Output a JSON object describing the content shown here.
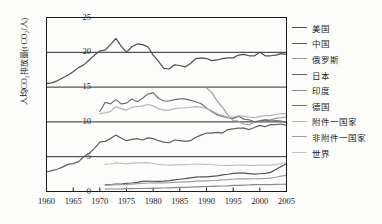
{
  "chart_data": {
    "type": "line",
    "title": "",
    "xlabel": "",
    "ylabel": "人均CO₂排放量(t CO₂/人)",
    "ylabel_main": "人均CO",
    "ylabel_sub": "2",
    "ylabel_tail": "排放量(t CO",
    "ylabel_sub2": "2",
    "ylabel_end": "/人)",
    "xlim": [
      1960,
      2005
    ],
    "ylim": [
      0,
      25
    ],
    "xticks": [
      1960,
      1965,
      1970,
      1975,
      1980,
      1985,
      1990,
      1995,
      2000,
      2005
    ],
    "yticks": [
      0,
      5,
      10,
      15,
      20,
      25
    ],
    "grid": "horizontal",
    "legend_position": "right",
    "series": [
      {
        "name": "美国",
        "color": "#4d4d4d",
        "x": [
          1960,
          1961,
          1962,
          1963,
          1964,
          1965,
          1966,
          1967,
          1968,
          1969,
          1970,
          1971,
          1972,
          1973,
          1974,
          1975,
          1976,
          1977,
          1978,
          1979,
          1980,
          1981,
          1982,
          1983,
          1984,
          1985,
          1986,
          1987,
          1988,
          1989,
          1990,
          1991,
          1992,
          1993,
          1994,
          1995,
          1996,
          1997,
          1998,
          1999,
          2000,
          2001,
          2002,
          2003,
          2004,
          2005
        ],
        "values": [
          15.5,
          15.6,
          15.9,
          16.3,
          16.7,
          17.2,
          17.8,
          18.2,
          18.9,
          19.6,
          20.2,
          20.3,
          21.1,
          22.0,
          20.9,
          20.0,
          20.8,
          21.2,
          21.1,
          20.8,
          19.6,
          18.7,
          17.7,
          17.6,
          18.2,
          18.1,
          17.9,
          18.4,
          19.1,
          19.2,
          19.1,
          18.8,
          18.9,
          19.1,
          19.2,
          19.2,
          19.6,
          19.7,
          19.5,
          19.5,
          20.0,
          19.5,
          19.5,
          19.6,
          19.8,
          19.7
        ]
      },
      {
        "name": "中国",
        "color": "#555555",
        "x": [
          1971,
          1972,
          1973,
          1974,
          1975,
          1976,
          1977,
          1978,
          1979,
          1980,
          1981,
          1982,
          1983,
          1984,
          1985,
          1986,
          1987,
          1988,
          1989,
          1990,
          1991,
          1992,
          1993,
          1994,
          1995,
          1996,
          1997,
          1998,
          1999,
          2000,
          2001,
          2002,
          2003,
          2004,
          2005
        ],
        "values": [
          0.95,
          1.0,
          1.05,
          1.05,
          1.18,
          1.22,
          1.32,
          1.45,
          1.48,
          1.47,
          1.45,
          1.5,
          1.57,
          1.68,
          1.76,
          1.85,
          1.96,
          2.07,
          2.12,
          2.1,
          2.18,
          2.25,
          2.38,
          2.48,
          2.6,
          2.65,
          2.63,
          2.56,
          2.5,
          2.55,
          2.6,
          2.75,
          3.15,
          3.6,
          4.0
        ]
      },
      {
        "name": "俄罗斯",
        "color": "#9a9a9a",
        "x": [
          1990,
          1991,
          1992,
          1993,
          1994,
          1995,
          1996,
          1997,
          1998,
          1999,
          2000,
          2001,
          2002,
          2003,
          2004,
          2005
        ],
        "values": [
          14.9,
          14.2,
          13.0,
          12.1,
          11.0,
          10.2,
          10.1,
          9.7,
          9.6,
          10.0,
          10.2,
          10.3,
          10.3,
          10.5,
          10.6,
          10.7
        ]
      },
      {
        "name": "日本",
        "color": "#5f5f5f",
        "x": [
          1960,
          1961,
          1962,
          1963,
          1964,
          1965,
          1966,
          1967,
          1968,
          1969,
          1970,
          1971,
          1972,
          1973,
          1974,
          1975,
          1976,
          1977,
          1978,
          1979,
          1980,
          1981,
          1982,
          1983,
          1984,
          1985,
          1986,
          1987,
          1988,
          1989,
          1990,
          1991,
          1992,
          1993,
          1994,
          1995,
          1996,
          1997,
          1998,
          1999,
          2000,
          2001,
          2002,
          2003,
          2004,
          2005
        ],
        "values": [
          2.8,
          3.0,
          3.2,
          3.5,
          3.9,
          4.0,
          4.3,
          5.0,
          5.5,
          6.2,
          7.1,
          7.2,
          7.6,
          8.1,
          7.7,
          7.3,
          7.5,
          7.6,
          7.4,
          7.7,
          7.6,
          7.3,
          7.1,
          7.0,
          7.4,
          7.3,
          7.2,
          7.3,
          7.8,
          8.1,
          8.4,
          8.4,
          8.5,
          8.4,
          8.9,
          9.0,
          9.1,
          9.1,
          8.9,
          9.2,
          9.5,
          9.3,
          9.6,
          9.6,
          9.7,
          9.5
        ]
      },
      {
        "name": "印度",
        "color": "#8a8a8a",
        "x": [
          1971,
          1972,
          1973,
          1974,
          1975,
          1976,
          1977,
          1978,
          1979,
          1980,
          1981,
          1982,
          1983,
          1984,
          1985,
          1986,
          1987,
          1988,
          1989,
          1990,
          1991,
          1992,
          1993,
          1994,
          1995,
          1996,
          1997,
          1998,
          1999,
          2000,
          2001,
          2002,
          2003,
          2004,
          2005
        ],
        "values": [
          0.35,
          0.36,
          0.36,
          0.37,
          0.4,
          0.42,
          0.43,
          0.43,
          0.46,
          0.45,
          0.48,
          0.5,
          0.52,
          0.55,
          0.58,
          0.6,
          0.63,
          0.66,
          0.7,
          0.72,
          0.75,
          0.78,
          0.79,
          0.82,
          0.87,
          0.89,
          0.93,
          0.94,
          0.98,
          0.99,
          0.99,
          1.0,
          1.02,
          1.04,
          1.07
        ]
      },
      {
        "name": "德国",
        "color": "#707070",
        "x": [
          1970,
          1971,
          1972,
          1973,
          1974,
          1975,
          1976,
          1977,
          1978,
          1979,
          1980,
          1981,
          1982,
          1983,
          1984,
          1985,
          1986,
          1987,
          1988,
          1989,
          1990,
          1991,
          1992,
          1993,
          1994,
          1995,
          1996,
          1997,
          1998,
          1999,
          2000,
          2001,
          2002,
          2003,
          2004,
          2005
        ],
        "values": [
          11.5,
          12.8,
          12.6,
          13.2,
          12.6,
          12.7,
          13.3,
          12.9,
          13.4,
          14.0,
          14.2,
          13.4,
          13.0,
          13.0,
          13.2,
          13.3,
          13.3,
          13.1,
          12.9,
          12.6,
          12.0,
          11.5,
          11.0,
          10.8,
          10.6,
          10.5,
          10.8,
          10.4,
          10.3,
          10.0,
          10.1,
          10.3,
          10.1,
          10.2,
          10.1,
          9.9
        ]
      },
      {
        "name": "附件一国家",
        "color": "#b5b5b5",
        "x": [
          1970,
          1971,
          1972,
          1973,
          1974,
          1975,
          1976,
          1977,
          1978,
          1979,
          1980,
          1981,
          1982,
          1983,
          1984,
          1985,
          1986,
          1987,
          1988,
          1989,
          1990,
          1991,
          1992,
          1993,
          1994,
          1995,
          1996,
          1997,
          1998,
          1999,
          2000,
          2001,
          2002,
          2003,
          2004,
          2005
        ],
        "values": [
          11.2,
          11.3,
          11.5,
          12.2,
          11.9,
          11.7,
          12.1,
          12.2,
          12.3,
          12.5,
          12.3,
          11.9,
          11.7,
          11.7,
          11.9,
          12.0,
          12.0,
          12.1,
          12.2,
          12.1,
          11.9,
          11.6,
          11.2,
          10.9,
          10.7,
          10.7,
          10.9,
          10.8,
          10.7,
          10.6,
          10.8,
          10.9,
          10.9,
          11.1,
          11.2,
          11.2
        ]
      },
      {
        "name": "非附件一国家",
        "color": "#a0a0a0",
        "x": [
          1971,
          1972,
          1973,
          1974,
          1975,
          1976,
          1977,
          1978,
          1979,
          1980,
          1981,
          1982,
          1983,
          1984,
          1985,
          1986,
          1987,
          1988,
          1989,
          1990,
          1991,
          1992,
          1993,
          1994,
          1995,
          1996,
          1997,
          1998,
          1999,
          2000,
          2001,
          2002,
          2003,
          2004,
          2005
        ],
        "values": [
          0.9,
          0.94,
          0.98,
          1.0,
          1.02,
          1.07,
          1.12,
          1.16,
          1.22,
          1.23,
          1.23,
          1.24,
          1.26,
          1.3,
          1.34,
          1.38,
          1.43,
          1.48,
          1.52,
          1.54,
          1.58,
          1.61,
          1.66,
          1.7,
          1.76,
          1.8,
          1.83,
          1.82,
          1.83,
          1.86,
          1.88,
          1.93,
          2.05,
          2.2,
          2.32
        ]
      },
      {
        "name": "世界",
        "color": "#c2c2c2",
        "x": [
          1971,
          1972,
          1973,
          1974,
          1975,
          1976,
          1977,
          1978,
          1979,
          1980,
          1981,
          1982,
          1983,
          1984,
          1985,
          1986,
          1987,
          1988,
          1989,
          1990,
          1991,
          1992,
          1993,
          1994,
          1995,
          1996,
          1997,
          1998,
          1999,
          2000,
          2001,
          2002,
          2003,
          2004,
          2005
        ],
        "values": [
          3.9,
          3.95,
          4.1,
          4.05,
          3.98,
          4.08,
          4.1,
          4.1,
          4.15,
          4.02,
          3.9,
          3.82,
          3.78,
          3.82,
          3.85,
          3.86,
          3.88,
          3.92,
          3.92,
          3.9,
          3.88,
          3.8,
          3.76,
          3.74,
          3.76,
          3.8,
          3.8,
          3.76,
          3.74,
          3.78,
          3.78,
          3.8,
          3.9,
          4.02,
          4.1
        ]
      }
    ]
  },
  "axes": {
    "y_tick_labels": [
      "25",
      "20",
      "15",
      "10",
      "5",
      "0"
    ],
    "x_tick_labels": [
      "1960",
      "1965",
      "1970",
      "1975",
      "1980",
      "1985",
      "1990",
      "1995",
      "2000",
      "2005"
    ]
  },
  "legend": {
    "items": [
      {
        "label": "美国",
        "color": "#4d4d4d"
      },
      {
        "label": "中国",
        "color": "#555555"
      },
      {
        "label": "俄罗斯",
        "color": "#9a9a9a"
      },
      {
        "label": "日本",
        "color": "#5f5f5f"
      },
      {
        "label": "印度",
        "color": "#8a8a8a"
      },
      {
        "label": "德国",
        "color": "#707070"
      },
      {
        "label": "附件一国家",
        "color": "#b5b5b5"
      },
      {
        "label": "非附件一国家",
        "color": "#a0a0a0"
      },
      {
        "label": "世界",
        "color": "#c2c2c2"
      }
    ]
  },
  "style": {
    "axis_color": "#1a1a1a",
    "grid_color": "#2a2a2a",
    "background": "#fdfdfc"
  }
}
